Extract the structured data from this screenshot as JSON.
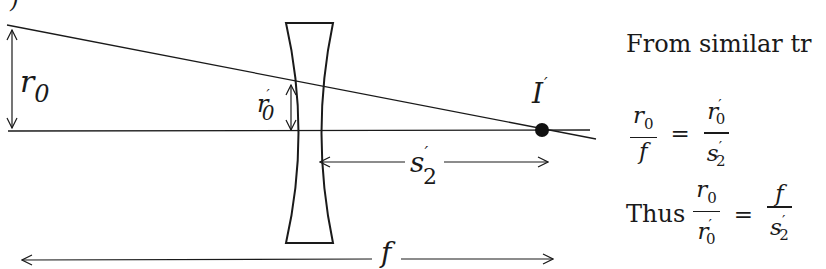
{
  "diagram": {
    "corner_mark": ")",
    "labels": {
      "r0": {
        "base": "r",
        "sub": "0"
      },
      "r0_prime": {
        "base": "r",
        "sub": "0",
        "sup": "′"
      },
      "image_point": {
        "base": "I",
        "sup": "′"
      },
      "s2_prime": {
        "base": "s",
        "sub": "2",
        "sup": "′"
      },
      "f": {
        "base": "f"
      }
    },
    "colors": {
      "ink": "#1a1a1a",
      "background": "#ffffff"
    }
  },
  "text": {
    "heading": "From similar tr",
    "eq1": {
      "lhs_num": "r",
      "lhs_num_sub": "0",
      "lhs_den": "f",
      "equals": "=",
      "rhs_num": "r",
      "rhs_num_sub": "0",
      "rhs_num_sup": "′",
      "rhs_den": "s",
      "rhs_den_sub": "2",
      "rhs_den_sup": "′"
    },
    "eq2": {
      "prefix": "Thus",
      "lhs_num": "r",
      "lhs_num_sub": "0",
      "lhs_den": "r",
      "lhs_den_sub": "0",
      "lhs_den_sup": "′",
      "equals": "=",
      "rhs_num": "f",
      "rhs_den": "s",
      "rhs_den_sub": "2",
      "rhs_den_sup": "′"
    }
  }
}
